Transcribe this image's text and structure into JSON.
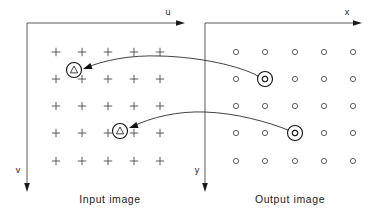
{
  "figure": {
    "width": 378,
    "height": 215,
    "background": "#ffffff",
    "ink_color": "#1a1a1a",
    "grid_color": "#4a4a4a"
  },
  "panels": {
    "input": {
      "caption": "Input image",
      "caption_x": 110,
      "caption_y": 203,
      "horizontal_axis_label": "u",
      "horizontal_axis_label_x": 168,
      "horizontal_axis_label_y": 15,
      "vertical_axis_label": "v",
      "vertical_axis_label_x": 18,
      "vertical_axis_label_y": 173,
      "origin_x": 27,
      "origin_y": 23,
      "h_axis_end_x": 185,
      "v_axis_end_y": 192,
      "marker_glyph": "plus",
      "grid_cols_x": [
        56,
        82,
        108,
        134,
        160
      ],
      "grid_rows_y": [
        52,
        79,
        106,
        133,
        161
      ],
      "highlights": [
        {
          "label": "inverse-mapped-sample-upper",
          "glyph": "triangle",
          "x": 74,
          "y": 70,
          "ring_radius": 7.5
        },
        {
          "label": "inverse-mapped-sample-lower",
          "glyph": "triangle",
          "x": 120,
          "y": 131,
          "ring_radius": 7.5
        }
      ]
    },
    "output": {
      "caption": "Output image",
      "caption_x": 290,
      "caption_y": 203,
      "horizontal_axis_label": "x",
      "horizontal_axis_label_x": 347,
      "horizontal_axis_label_y": 15,
      "vertical_axis_label": "y",
      "vertical_axis_label_x": 197,
      "vertical_axis_label_y": 173,
      "origin_x": 205,
      "origin_y": 23,
      "h_axis_end_x": 362,
      "v_axis_end_y": 192,
      "marker_glyph": "circle",
      "grid_cols_x": [
        236,
        265,
        295,
        324,
        353
      ],
      "grid_rows_y": [
        52,
        79,
        106,
        133,
        161
      ],
      "highlights": [
        {
          "label": "output-pixel-upper",
          "glyph": "circle",
          "x": 265,
          "y": 79,
          "ring_radius": 7.5
        },
        {
          "label": "output-pixel-lower",
          "glyph": "circle",
          "x": 295,
          "y": 133,
          "ring_radius": 7.5
        }
      ]
    }
  },
  "mapping_arrows": [
    {
      "label": "mapping-arrow-upper",
      "from_x": 258,
      "from_y": 76,
      "to_x": 83,
      "to_y": 69,
      "path": "M 258 76 C 240 66, 200 57, 160 56 C 130 55, 105 60, 85 68",
      "head_x": 83,
      "head_y": 69,
      "head_angle": 160
    },
    {
      "label": "mapping-arrow-lower",
      "from_x": 288,
      "from_y": 130,
      "to_x": 129,
      "to_y": 128,
      "path": "M 288 130 C 268 122, 236 113, 205 112 C 178 111, 152 117, 131 127",
      "head_x": 129,
      "head_y": 128,
      "head_angle": 160
    }
  ]
}
